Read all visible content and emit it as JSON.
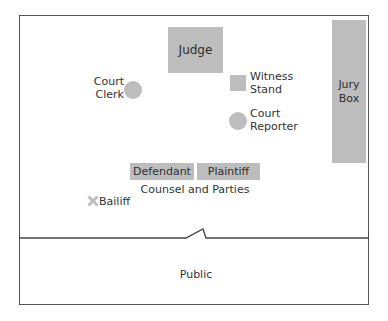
{
  "diagram": {
    "areas": {
      "judge": "Judge",
      "jury_box_line1": "Jury",
      "jury_box_line2": "Box",
      "witness_stand_line1": "Witness",
      "witness_stand_line2": "Stand",
      "court_clerk_line1": "Court",
      "court_clerk_line2": "Clerk",
      "court_reporter_line1": "Court",
      "court_reporter_line2": "Reporter",
      "defendant": "Defendant",
      "plaintiff": "Plaintiff",
      "counsel_and_parties": "Counsel and Parties",
      "bailiff": "Bailiff",
      "public": "Public"
    },
    "colors": {
      "fill": "#bdbdbd",
      "border": "#555555",
      "text": "#333333"
    }
  }
}
